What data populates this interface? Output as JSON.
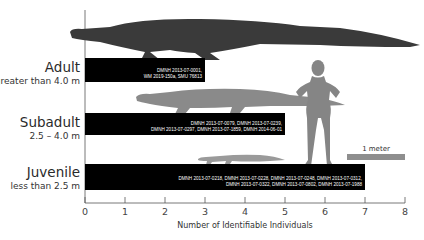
{
  "chart_data": {
    "type": "bar",
    "orientation": "horizontal",
    "title": "",
    "xlabel": "Number of Identifiable Individuals",
    "ylabel": "",
    "xlim": [
      0,
      8
    ],
    "x_ticks": [
      0,
      1,
      2,
      3,
      4,
      5,
      6,
      7,
      8
    ],
    "grid": false,
    "categories": [
      {
        "name": "Adult",
        "range": "greater than 4.0 m"
      },
      {
        "name": "Subadult",
        "range": "2.5 – 4.0 m"
      },
      {
        "name": "Juvenile",
        "range": "less than 2.5 m"
      }
    ],
    "values": [
      3,
      5,
      7
    ],
    "bar_labels": [
      [
        "DMNH 2013-07-0001,",
        "WM 2019-150a, SMU 76813"
      ],
      [
        "DMNH 2013-07-0079, DMNH 2013-07-0239,",
        "DMNH 2013-07-0297, DMNH 2013-07-1859, DMNH 2014-06-01"
      ],
      [
        "DMNH 2013-07-0218, DMNH 2013-07-0228, DMNH 2013-07-0248, DMNH 2013-07-0312,",
        "DMNH 2013-07-0322, DMNH 2013-07-0802, DMNH 2013-07-1988"
      ]
    ],
    "bar_color": "#000000",
    "silhouette_colors": {
      "adult": "#3a3a3a",
      "subadult": "#8a8a8a",
      "juvenile": "#9a9a9a",
      "human": "#858585"
    },
    "scale_bar": {
      "label": "1 meter",
      "color": "#8e8e8e"
    }
  }
}
